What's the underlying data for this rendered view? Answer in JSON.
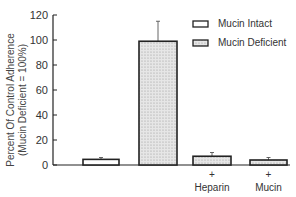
{
  "chart_data": {
    "type": "bar",
    "title": "",
    "xlabel": "",
    "ylabel": "Percent Of Control Adherence (Mucin Deficient = 100%)",
    "ylabel_lines": [
      "Percent Of Control Adherence",
      "(Mucin Deficient = 100%)"
    ],
    "ylim": [
      0,
      120
    ],
    "yticks": [
      0,
      20,
      40,
      60,
      80,
      100,
      120
    ],
    "grid": false,
    "legend_position": "top-right",
    "categories": [
      "Mucin Intact",
      "Mucin Deficient",
      "+ Heparin",
      "+ Mucin"
    ],
    "category_labels": [
      {
        "plus": "",
        "label": ""
      },
      {
        "plus": "",
        "label": ""
      },
      {
        "plus": "+",
        "label": "Heparin"
      },
      {
        "plus": "+",
        "label": "Mucin"
      }
    ],
    "series": [
      {
        "name": "Mucin Intact",
        "fill": "open",
        "values": [
          4.5,
          null,
          null,
          null
        ],
        "errors": [
          1.5,
          null,
          null,
          null
        ]
      },
      {
        "name": "Mucin Deficient",
        "fill": "stippled",
        "values": [
          null,
          99,
          7,
          4
        ],
        "errors": [
          null,
          16,
          3,
          2
        ]
      }
    ],
    "bars": [
      {
        "label": "Mucin Intact",
        "value": 4.5,
        "error": 1.5,
        "fill": "open"
      },
      {
        "label": "Mucin Deficient",
        "value": 99,
        "error": 16,
        "fill": "stippled"
      },
      {
        "label": "Mucin Deficient + Heparin",
        "value": 7,
        "error": 3,
        "fill": "stippled"
      },
      {
        "label": "Mucin Deficient + Mucin",
        "value": 4,
        "error": 2,
        "fill": "stippled"
      }
    ]
  },
  "legend": {
    "items": [
      {
        "label": "Mucin Intact",
        "fill": "open"
      },
      {
        "label": "Mucin Deficient",
        "fill": "stippled"
      }
    ]
  },
  "colors": {
    "ink": "#222222",
    "stipple_bg": "#e6e6e6",
    "stipple_dot": "#9a9a9a"
  }
}
